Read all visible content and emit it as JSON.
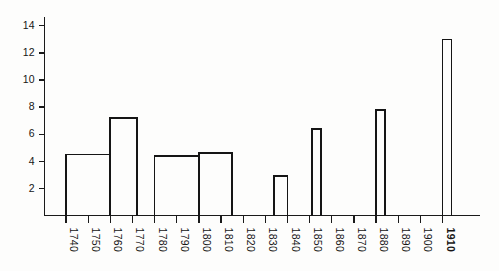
{
  "chart_data": {
    "type": "bar",
    "title": "",
    "subtitle": "",
    "xlabel": "",
    "ylabel": "",
    "grid": false,
    "legend": false,
    "bar_style": "outline-only",
    "orientation": "vertical",
    "xlim": [
      1735,
      1920
    ],
    "ylim": [
      0,
      15
    ],
    "ytick_values": [
      2,
      4,
      6,
      8,
      10,
      12,
      14
    ],
    "ytick_labels": [
      "2",
      "4",
      "6",
      "8",
      "10",
      "12",
      "14"
    ],
    "xtick_values": [
      1740,
      1750,
      1760,
      1770,
      1780,
      1790,
      1800,
      1810,
      1820,
      1830,
      1840,
      1850,
      1860,
      1870,
      1880,
      1890,
      1900,
      1910
    ],
    "xtick_labels": [
      "1740",
      "1750",
      "1760",
      "1770",
      "1780",
      "1790",
      "1800",
      "1810",
      "1820",
      "1830",
      "1840",
      "1850",
      "1860",
      "1870",
      "1880",
      "1890",
      "1900",
      "1910"
    ],
    "xtick_rotation": 90,
    "categories": [
      "1740",
      "1750",
      "1760",
      "1770",
      "1780",
      "1790",
      "1800",
      "1810",
      "1820",
      "1830",
      "1840",
      "1850",
      "1860",
      "1870",
      "1880",
      "1890",
      "1900",
      "1910"
    ],
    "values": [
      4.5,
      4.5,
      7.2,
      0,
      4.4,
      4.4,
      4.6,
      4.6,
      0,
      2.9,
      0,
      6.4,
      0,
      0,
      7.8,
      0,
      0,
      13.0
    ],
    "bars": [
      {
        "label": "1740-1760",
        "x_start": 1740,
        "x_end": 1760,
        "value": 4.5
      },
      {
        "label": "1760-1772",
        "x_start": 1760,
        "x_end": 1772,
        "value": 7.2
      },
      {
        "label": "1780-1800",
        "x_start": 1780,
        "x_end": 1800,
        "value": 4.4
      },
      {
        "label": "1800-1815",
        "x_start": 1800,
        "x_end": 1815,
        "value": 4.6
      },
      {
        "label": "1834-1840",
        "x_start": 1834,
        "x_end": 1840,
        "value": 2.9
      },
      {
        "label": "1851-1855",
        "x_start": 1851,
        "x_end": 1855,
        "value": 6.4
      },
      {
        "label": "1880-1884",
        "x_start": 1880,
        "x_end": 1884,
        "value": 7.8
      },
      {
        "label": "1910-1914",
        "x_start": 1910,
        "x_end": 1914,
        "value": 13.0
      }
    ],
    "colors": {
      "bar_stroke": "#151515",
      "axis": "#1a1a1a",
      "text": "#151515",
      "background": "#fdfdfc"
    }
  }
}
